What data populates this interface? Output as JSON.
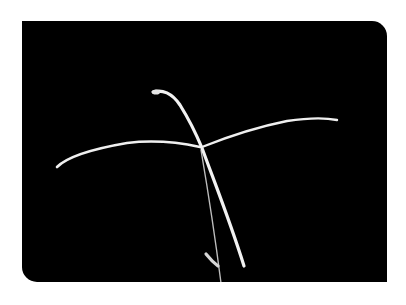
{
  "image": {
    "subject": "grass seed head with crossing spikelets",
    "alt": "Photograph of a grass inflorescence with two arching spikelets crossing against a black background",
    "background_color": "#000000",
    "page_color": "#ffffff",
    "plant_color": "#e8e8e8"
  }
}
